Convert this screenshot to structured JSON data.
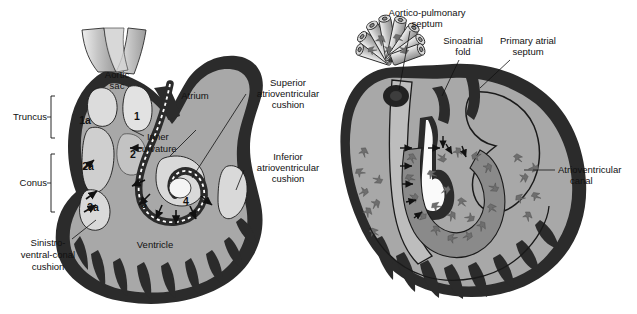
{
  "figure": {
    "width": 637,
    "height": 314,
    "background": "#ffffff",
    "panels": 2
  },
  "palette": {
    "myocardium_dark": "#2b2b2b",
    "lumen_mid_gray": "#a8a8a8",
    "cushion_light": "#d9d9d9",
    "vessel_gray": "#b8b8b8",
    "cell_gray": "#6e6e6e",
    "endocardium_line": "#1a1a1a",
    "label_text": "#111111",
    "white": "#ffffff"
  },
  "left_panel": {
    "name": "looping-heart-tube-segments",
    "labels": {
      "aortic_sac": "Aortic\nsac",
      "aortic_sac_line1": "Aortic",
      "aortic_sac_line2": "sac",
      "atrium": "Atrium",
      "ventricle": "Ventricle",
      "inner_curvature_line1": "Inner",
      "inner_curvature_line2": "curvature",
      "truncus": "Truncus",
      "conus": "Conus",
      "superior_av_cushion_line1": "Superior",
      "superior_av_cushion_line2": "atrioventricular",
      "superior_av_cushion_line3": "cushion",
      "inferior_av_cushion_line1": "Inferior",
      "inferior_av_cushion_line2": "atrioventricular",
      "inferior_av_cushion_line3": "cushion",
      "sinistro_ventral_conal_line1": "Sinistro-",
      "sinistro_ventral_conal_line2": "ventral-conal",
      "sinistro_ventral_conal_line3": "cushion"
    },
    "numbered_markers": [
      {
        "id": "1a",
        "label": "1a"
      },
      {
        "id": "1",
        "label": "1"
      },
      {
        "id": "2a",
        "label": "2a"
      },
      {
        "id": "2",
        "label": "2"
      },
      {
        "id": "3a",
        "label": "3a"
      },
      {
        "id": "3",
        "label": "3"
      },
      {
        "id": "4",
        "label": "4"
      }
    ],
    "brackets": [
      {
        "label": "Truncus",
        "covers": [
          "1a",
          "1"
        ]
      },
      {
        "label": "Conus",
        "covers": [
          "2a",
          "3a"
        ]
      }
    ]
  },
  "right_panel": {
    "name": "neural-crest-cell-migration-heart",
    "labels": {
      "aortico_pulmonary_septum_line1": "Aortico-pulmonary",
      "aortico_pulmonary_septum_line2": "septum",
      "sinoatrial_fold_line1": "Sinoatrial",
      "sinoatrial_fold_line2": "fold",
      "primary_atrial_septum_line1": "Primary atrial",
      "primary_atrial_septum_line2": "septum",
      "atrioventricular_canal_line1": "Atrioventricular",
      "atrioventricular_canal_line2": "canal"
    },
    "features": {
      "pharyngeal_arch_vessels_count": 8,
      "migrating_cell_symbol": "arrowhead",
      "migration_arrows_present": true
    }
  }
}
